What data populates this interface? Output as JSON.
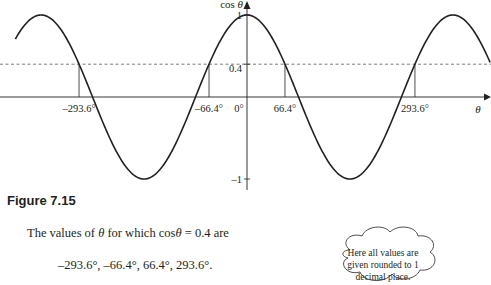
{
  "chart_data": {
    "type": "line",
    "title": "",
    "function": "cos",
    "xlabel": "θ",
    "ylabel": "cos θ",
    "xlim_degrees": [
      -405,
      425
    ],
    "ylim": [
      -1,
      1
    ],
    "grid": false,
    "y_ticks": [
      {
        "value": 1,
        "label": "1"
      },
      {
        "value": 0.4,
        "label": "0.4"
      },
      {
        "value": -1,
        "label": "–1"
      }
    ],
    "x_ticks": [
      {
        "value": -293.6,
        "label": "–293.6°"
      },
      {
        "value": -66.4,
        "label": "–66.4°"
      },
      {
        "value": 0,
        "label": "0°"
      },
      {
        "value": 66.4,
        "label": "66.4°"
      },
      {
        "value": 293.6,
        "label": "293.6°"
      }
    ],
    "reference_line": {
      "y": 0.4,
      "style": "dashed"
    },
    "intersection_points": [
      -293.6,
      -66.4,
      66.4,
      293.6
    ],
    "series": [
      {
        "name": "cos θ",
        "expression": "cos(θ)"
      }
    ]
  },
  "figure": {
    "caption": "Figure 7.15"
  },
  "text": {
    "statement_prefix": "The values of ",
    "statement_theta": "θ",
    "statement_middle": " for which cos",
    "statement_theta2": "θ",
    "statement_suffix": " = 0.4 are",
    "values": "–293.6°, –66.4°, 66.4°, 293.6°."
  },
  "note": {
    "line1": "Here all values are",
    "line2": "given rounded to 1",
    "line3": "decimal place."
  }
}
